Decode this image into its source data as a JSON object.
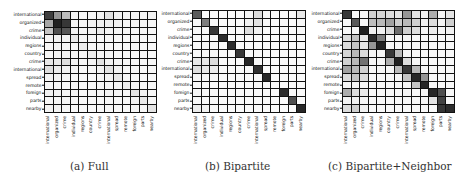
{
  "chart_data": [
    {
      "type": "heatmap",
      "title": "(a) Full",
      "caption": "(a) Full",
      "rows": [
        "international",
        "organized",
        "crime",
        "individual",
        "regions",
        "country",
        "crime",
        "international",
        "spread",
        "remote",
        "foreign",
        "parts",
        "nearby"
      ],
      "cols": [
        "international",
        "organized",
        "crime",
        "individual",
        "regions",
        "country",
        "crime",
        "international",
        "spread",
        "remote",
        "foreign",
        "parts",
        "nearby"
      ],
      "colormap": "greys",
      "values": [
        [
          0.82,
          0.45,
          0.28,
          0.04,
          0.03,
          0.04,
          0.05,
          0.12,
          0.05,
          0.04,
          0.05,
          0.04,
          0.05
        ],
        [
          0.38,
          0.95,
          0.85,
          0.04,
          0.04,
          0.05,
          0.06,
          0.06,
          0.05,
          0.04,
          0.05,
          0.04,
          0.04
        ],
        [
          0.25,
          0.75,
          0.72,
          0.05,
          0.04,
          0.05,
          0.08,
          0.05,
          0.04,
          0.04,
          0.04,
          0.04,
          0.04
        ],
        [
          0.05,
          0.06,
          0.05,
          0.1,
          0.04,
          0.04,
          0.03,
          0.04,
          0.03,
          0.03,
          0.04,
          0.03,
          0.03
        ],
        [
          0.04,
          0.05,
          0.04,
          0.04,
          0.08,
          0.04,
          0.04,
          0.03,
          0.03,
          0.03,
          0.03,
          0.03,
          0.03
        ],
        [
          0.04,
          0.05,
          0.05,
          0.04,
          0.04,
          0.08,
          0.04,
          0.04,
          0.03,
          0.03,
          0.03,
          0.03,
          0.03
        ],
        [
          0.1,
          0.09,
          0.14,
          0.04,
          0.04,
          0.05,
          0.12,
          0.05,
          0.04,
          0.03,
          0.04,
          0.04,
          0.04
        ],
        [
          0.14,
          0.08,
          0.06,
          0.04,
          0.03,
          0.04,
          0.05,
          0.12,
          0.05,
          0.03,
          0.04,
          0.03,
          0.04
        ],
        [
          0.05,
          0.05,
          0.04,
          0.03,
          0.03,
          0.03,
          0.04,
          0.05,
          0.1,
          0.04,
          0.03,
          0.03,
          0.03
        ],
        [
          0.04,
          0.04,
          0.03,
          0.03,
          0.03,
          0.03,
          0.03,
          0.03,
          0.04,
          0.07,
          0.03,
          0.03,
          0.03
        ],
        [
          0.06,
          0.05,
          0.04,
          0.04,
          0.03,
          0.04,
          0.04,
          0.05,
          0.04,
          0.03,
          0.12,
          0.06,
          0.04
        ],
        [
          0.04,
          0.04,
          0.04,
          0.03,
          0.03,
          0.03,
          0.03,
          0.04,
          0.03,
          0.03,
          0.05,
          0.1,
          0.04
        ],
        [
          0.05,
          0.05,
          0.04,
          0.03,
          0.03,
          0.03,
          0.03,
          0.04,
          0.03,
          0.03,
          0.04,
          0.04,
          0.12
        ]
      ],
      "grid": true,
      "legend": false
    },
    {
      "type": "heatmap",
      "title": "(b) Bipartite",
      "caption": "(b) Bipartite",
      "rows": [
        "international",
        "organized",
        "crime",
        "individual",
        "regions",
        "country",
        "crime",
        "international",
        "spread",
        "remote",
        "foreign",
        "parts",
        "nearby"
      ],
      "cols": [
        "international",
        "organized",
        "crime",
        "individual",
        "regions",
        "country",
        "crime",
        "international",
        "spread",
        "remote",
        "foreign",
        "parts",
        "nearby"
      ],
      "colormap": "greys",
      "values": [
        [
          0.7,
          0.02,
          0.03,
          0.02,
          0.02,
          0.02,
          0.04,
          0.15,
          0.03,
          0.02,
          0.03,
          0.02,
          0.1
        ],
        [
          0.03,
          0.55,
          0.03,
          0.02,
          0.02,
          0.02,
          0.06,
          0.12,
          0.03,
          0.02,
          0.03,
          0.02,
          0.04
        ],
        [
          0.03,
          0.03,
          0.85,
          0.02,
          0.02,
          0.02,
          0.14,
          0.06,
          0.02,
          0.02,
          0.02,
          0.02,
          0.03
        ],
        [
          0.03,
          0.03,
          0.03,
          0.9,
          0.02,
          0.02,
          0.02,
          0.02,
          0.02,
          0.02,
          0.02,
          0.02,
          0.02
        ],
        [
          0.03,
          0.03,
          0.03,
          0.02,
          0.9,
          0.02,
          0.02,
          0.02,
          0.02,
          0.02,
          0.02,
          0.02,
          0.02
        ],
        [
          0.03,
          0.03,
          0.03,
          0.02,
          0.02,
          0.85,
          0.02,
          0.02,
          0.02,
          0.02,
          0.02,
          0.02,
          0.02
        ],
        [
          0.1,
          0.1,
          0.14,
          0.02,
          0.02,
          0.02,
          0.92,
          0.03,
          0.02,
          0.02,
          0.02,
          0.02,
          0.02
        ],
        [
          0.14,
          0.1,
          0.08,
          0.02,
          0.02,
          0.02,
          0.03,
          0.88,
          0.02,
          0.02,
          0.02,
          0.02,
          0.02
        ],
        [
          0.05,
          0.04,
          0.03,
          0.02,
          0.02,
          0.02,
          0.02,
          0.03,
          0.92,
          0.02,
          0.02,
          0.02,
          0.02
        ],
        [
          0.03,
          0.03,
          0.02,
          0.02,
          0.02,
          0.02,
          0.02,
          0.02,
          0.02,
          0.02,
          0.02,
          0.02,
          0.02
        ],
        [
          0.04,
          0.04,
          0.03,
          0.02,
          0.02,
          0.02,
          0.02,
          0.02,
          0.02,
          0.02,
          0.9,
          0.02,
          0.02
        ],
        [
          0.03,
          0.03,
          0.03,
          0.02,
          0.02,
          0.02,
          0.02,
          0.02,
          0.02,
          0.02,
          0.02,
          0.75,
          0.02
        ],
        [
          0.08,
          0.06,
          0.03,
          0.02,
          0.02,
          0.02,
          0.02,
          0.02,
          0.02,
          0.02,
          0.02,
          0.02,
          0.92
        ]
      ],
      "grid": true,
      "legend": false
    },
    {
      "type": "heatmap",
      "title": "(c) Bipartite+Neighbor",
      "caption": "(c) Bipartite+Neighbor",
      "rows": [
        "international",
        "organized",
        "crime",
        "individual",
        "regions",
        "country",
        "crime",
        "international",
        "spread",
        "remote",
        "foreign",
        "parts",
        "nearby"
      ],
      "cols": [
        "international",
        "organized",
        "crime",
        "individual",
        "regions",
        "country",
        "crime",
        "international",
        "spread",
        "remote",
        "foreign",
        "parts",
        "nearby"
      ],
      "colormap": "greys",
      "values": [
        [
          0.85,
          0.02,
          0.03,
          0.2,
          0.18,
          0.15,
          0.12,
          0.45,
          0.12,
          0.05,
          0.35,
          0.05,
          0.12
        ],
        [
          0.03,
          0.7,
          0.03,
          0.28,
          0.3,
          0.4,
          0.22,
          0.3,
          0.2,
          0.06,
          0.15,
          0.05,
          0.2
        ],
        [
          0.03,
          0.03,
          0.95,
          0.06,
          0.06,
          0.15,
          0.62,
          0.2,
          0.14,
          0.04,
          0.08,
          0.04,
          0.06
        ],
        [
          0.15,
          0.25,
          0.1,
          0.9,
          0.55,
          0.04,
          0.04,
          0.04,
          0.03,
          0.03,
          0.03,
          0.03,
          0.03
        ],
        [
          0.15,
          0.25,
          0.12,
          0.45,
          0.95,
          0.04,
          0.04,
          0.04,
          0.03,
          0.03,
          0.03,
          0.03,
          0.03
        ],
        [
          0.18,
          0.3,
          0.15,
          0.04,
          0.04,
          0.85,
          0.3,
          0.04,
          0.03,
          0.03,
          0.03,
          0.03,
          0.03
        ],
        [
          0.2,
          0.3,
          0.6,
          0.04,
          0.04,
          0.35,
          0.95,
          0.15,
          0.04,
          0.03,
          0.03,
          0.03,
          0.03
        ],
        [
          0.4,
          0.3,
          0.2,
          0.03,
          0.04,
          0.04,
          0.3,
          0.85,
          0.3,
          0.04,
          0.03,
          0.03,
          0.03
        ],
        [
          0.15,
          0.25,
          0.15,
          0.03,
          0.03,
          0.03,
          0.04,
          0.25,
          0.92,
          0.45,
          0.03,
          0.03,
          0.03
        ],
        [
          0.04,
          0.05,
          0.04,
          0.03,
          0.03,
          0.03,
          0.03,
          0.04,
          0.25,
          0.92,
          0.03,
          0.03,
          0.03
        ],
        [
          0.35,
          0.15,
          0.08,
          0.03,
          0.03,
          0.03,
          0.03,
          0.04,
          0.03,
          0.03,
          0.92,
          0.75,
          0.03
        ],
        [
          0.05,
          0.06,
          0.04,
          0.03,
          0.03,
          0.03,
          0.03,
          0.03,
          0.03,
          0.03,
          0.12,
          0.8,
          0.03
        ],
        [
          0.15,
          0.2,
          0.06,
          0.03,
          0.03,
          0.03,
          0.03,
          0.03,
          0.03,
          0.03,
          0.03,
          0.85,
          0.9
        ]
      ],
      "grid": true,
      "legend": false
    }
  ],
  "panels": [
    {
      "id": "a",
      "caption": "(a) Full",
      "left": 44,
      "top": 11,
      "width": 113,
      "height": 102,
      "caption_x": 70
    },
    {
      "id": "b",
      "caption": "(b) Bipartite",
      "left": 192,
      "top": 10,
      "width": 114,
      "height": 103,
      "caption_x": 205
    },
    {
      "id": "c",
      "caption": "(c) Bipartite+Neighbor",
      "left": 342,
      "top": 10,
      "width": 113,
      "height": 103,
      "caption_x": 328
    }
  ]
}
